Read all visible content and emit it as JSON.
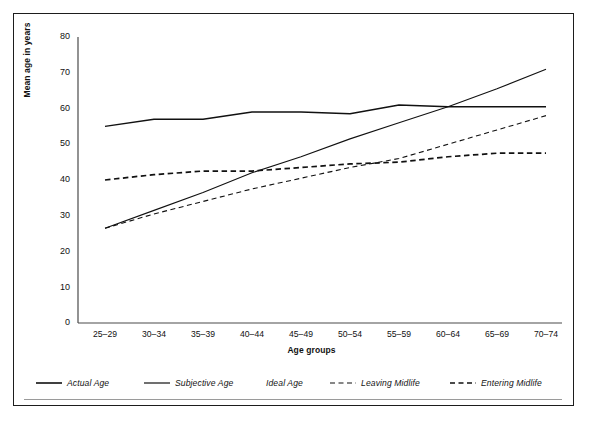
{
  "figure": {
    "ylabel": "Mean age in years",
    "xlabel": "Age groups"
  },
  "legend": {
    "items": [
      {
        "label": "Actual Age",
        "style": "solid",
        "color": "#111111"
      },
      {
        "label": "Subjective Age",
        "style": "solid",
        "color": "#111111"
      },
      {
        "label": "Ideal Age",
        "style": "none",
        "color": "#111111"
      },
      {
        "label": "Leaving Midlife",
        "style": "dashed-thin",
        "color": "#111111"
      },
      {
        "label": "Entering Midlife",
        "style": "dashed-thick",
        "color": "#111111"
      }
    ]
  },
  "chart_data": {
    "type": "line",
    "title": "",
    "xlabel": "Age groups",
    "ylabel": "Mean age in years",
    "categories": [
      "25–29",
      "30–34",
      "35–39",
      "40–44",
      "45–49",
      "50–54",
      "55–59",
      "60–64",
      "65–69",
      "70–74"
    ],
    "ylim": [
      0,
      80
    ],
    "yticks": [
      0,
      10,
      20,
      30,
      40,
      50,
      60,
      70,
      80
    ],
    "grid": false,
    "legend_position": "below",
    "series": [
      {
        "name": "Actual Age",
        "style": "solid",
        "width": 1.5,
        "values": [
          55.0,
          57.0,
          57.0,
          59.0,
          59.0,
          58.5,
          61.0,
          60.5,
          60.5,
          60.5
        ]
      },
      {
        "name": "Subjective Age",
        "style": "solid",
        "width": 1.1,
        "values": [
          26.5,
          31.5,
          36.5,
          42.0,
          46.5,
          51.5,
          56.0,
          60.5,
          65.5,
          71.0
        ]
      },
      {
        "name": "Leaving Midlife",
        "style": "dashed-thin",
        "width": 1.1,
        "values": [
          26.5,
          30.5,
          34.0,
          37.5,
          40.5,
          43.5,
          46.0,
          50.0,
          54.0,
          58.0
        ]
      },
      {
        "name": "Entering Midlife",
        "style": "dashed-thick",
        "width": 1.7,
        "values": [
          40.0,
          41.5,
          42.5,
          42.5,
          43.5,
          44.5,
          45.0,
          46.5,
          47.5,
          47.5
        ]
      }
    ]
  }
}
